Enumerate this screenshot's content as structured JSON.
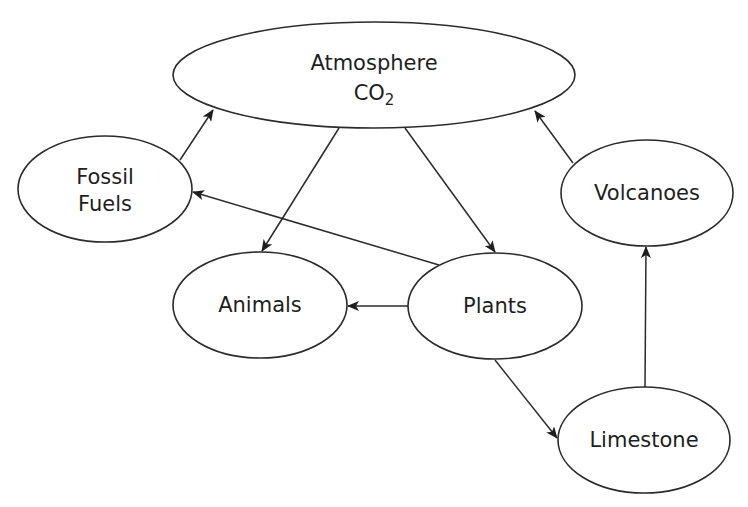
{
  "diagram": {
    "type": "flow / cycle diagram",
    "topic": "carbon cycle",
    "nodes": [
      {
        "id": "atmosphere",
        "label_line1": "Atmosphere",
        "label_line2": "CO",
        "label_sub": "2",
        "cx": 374,
        "cy": 75,
        "rx": 201,
        "ry": 53
      },
      {
        "id": "fossil_fuels",
        "label_line1": "Fossil",
        "label_line2": "Fuels",
        "cx": 105,
        "cy": 189,
        "rx": 87,
        "ry": 53
      },
      {
        "id": "volcanoes",
        "label_line1": "Volcanoes",
        "cx": 647,
        "cy": 193,
        "rx": 86,
        "ry": 53
      },
      {
        "id": "animals",
        "label_line1": "Animals",
        "cx": 260,
        "cy": 305,
        "rx": 87,
        "ry": 53
      },
      {
        "id": "plants",
        "label_line1": "Plants",
        "cx": 495,
        "cy": 306,
        "rx": 87,
        "ry": 53
      },
      {
        "id": "limestone",
        "label_line1": "Limestone",
        "cx": 644,
        "cy": 440,
        "rx": 86,
        "ry": 53
      }
    ],
    "edges": [
      {
        "from": "fossil_fuels",
        "to": "atmosphere",
        "x1": 180,
        "y1": 160,
        "x2": 213,
        "y2": 110
      },
      {
        "from": "volcanoes",
        "to": "atmosphere",
        "x1": 573,
        "y1": 163,
        "x2": 535,
        "y2": 111
      },
      {
        "from": "atmosphere",
        "to": "animals",
        "x1": 339,
        "y1": 128,
        "x2": 262,
        "y2": 251
      },
      {
        "from": "atmosphere",
        "to": "plants",
        "x1": 405,
        "y1": 128,
        "x2": 495,
        "y2": 252
      },
      {
        "from": "plants",
        "to": "fossil_fuels",
        "x1": 439,
        "y1": 265,
        "x2": 193,
        "y2": 192
      },
      {
        "from": "plants",
        "to": "animals",
        "x1": 408,
        "y1": 306,
        "x2": 348,
        "y2": 306
      },
      {
        "from": "plants",
        "to": "limestone",
        "x1": 495,
        "y1": 360,
        "x2": 557,
        "y2": 438
      },
      {
        "from": "limestone",
        "to": "volcanoes",
        "x1": 645,
        "y1": 387,
        "x2": 646,
        "y2": 247
      }
    ],
    "colors": {
      "stroke": "#2b2b2b",
      "text": "#1e1e1e",
      "background": "#ffffff"
    }
  }
}
